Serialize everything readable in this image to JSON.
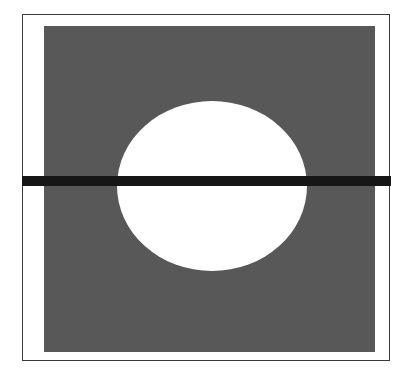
{
  "figure": {
    "elements": {
      "frame": {
        "shape": "rectangle",
        "stroke": "#3a3a3a",
        "fill": "#ffffff"
      },
      "plate": {
        "shape": "square",
        "fill": "#585858"
      },
      "aperture": {
        "shape": "ellipse",
        "fill": "#ffffff"
      },
      "bar": {
        "shape": "horizontal-bar",
        "fill": "#161616"
      }
    },
    "colors": {
      "background": "#ffffff",
      "plate": "#585858",
      "bar": "#161616",
      "frame": "#3a3a3a"
    }
  }
}
